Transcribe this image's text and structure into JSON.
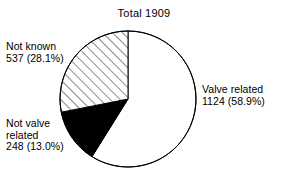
{
  "chart_data": {
    "type": "pie",
    "title": "Total 1909",
    "total": 1909,
    "xlabel": "",
    "ylabel": "",
    "legend_position": "callout-labels",
    "grid": false,
    "start_angle_deg": 0,
    "direction": "clockwise",
    "categories": [
      "Valve related",
      "Not valve related",
      "Not known"
    ],
    "values": [
      1124,
      248,
      537
    ],
    "percentages": [
      58.9,
      13.0,
      28.1
    ],
    "slices": [
      {
        "name": "Valve related",
        "value": 1124,
        "percent": 58.9,
        "fill": "white",
        "fill_color": "#ffffff",
        "stroke_color": "#000000",
        "start_deg": 0,
        "end_deg": 212.0
      },
      {
        "name": "Not valve related",
        "value": 248,
        "percent": 13.0,
        "fill": "solid-black",
        "fill_color": "#000000",
        "stroke_color": "#000000",
        "start_deg": 212.0,
        "end_deg": 258.8
      },
      {
        "name": "Not known",
        "value": 537,
        "percent": 28.1,
        "fill": "diagonal-hatch",
        "fill_color": "#ffffff",
        "stroke_color": "#000000",
        "start_deg": 258.8,
        "end_deg": 360.0
      }
    ]
  },
  "title": {
    "text": "Total 1909"
  },
  "labels": {
    "not_known": {
      "line1": "Not known",
      "line2": "537 (28.1%)"
    },
    "not_valve_related": {
      "line1": "Not valve",
      "line2": "related",
      "line3": "248 (13.0%)"
    },
    "valve_related": {
      "line1": "Valve related",
      "line2": "1124 (58.9%)"
    }
  },
  "geometry": {
    "center_x": 128,
    "center_y": 99,
    "radius": 68
  },
  "colors": {
    "background": "#ffffff",
    "outline": "#000000",
    "text": "#000000",
    "hatch": "#000000"
  }
}
